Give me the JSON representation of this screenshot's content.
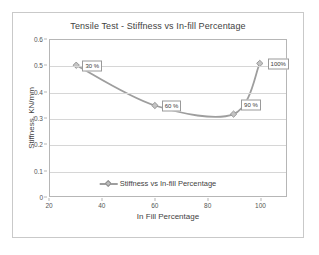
{
  "chart_data": {
    "type": "line",
    "title": "Tensile Test - Stiffness vs In-fill Percentage",
    "xlabel": "In Fill Percentage",
    "ylabel": "Stiffness, KN/mm",
    "xlim": [
      20,
      110
    ],
    "ylim": [
      0,
      0.6
    ],
    "x_ticks": [
      "20",
      "40",
      "60",
      "80",
      "100"
    ],
    "x_tick_values": [
      20,
      40,
      60,
      80,
      100
    ],
    "y_ticks": [
      "0",
      "0.1",
      "0.2",
      "0.3",
      "0.4",
      "0.5",
      "0.6"
    ],
    "y_tick_values": [
      0,
      0.1,
      0.2,
      0.3,
      0.4,
      0.5,
      0.6
    ],
    "grid": "horizontal",
    "legend_position": "inside-bottom-center",
    "series": [
      {
        "name": "Stiffness vs In-fill Percentage",
        "color": "#9e9e9e",
        "marker": "diamond",
        "x": [
          30,
          60,
          90,
          100
        ],
        "values": [
          0.503,
          0.348,
          0.315,
          0.51
        ],
        "point_labels": [
          "30 %",
          "60 %",
          "90 %",
          "100%"
        ]
      }
    ]
  },
  "legend": {
    "entries": [
      {
        "label": "Stiffness vs In-fill Percentage"
      }
    ]
  }
}
